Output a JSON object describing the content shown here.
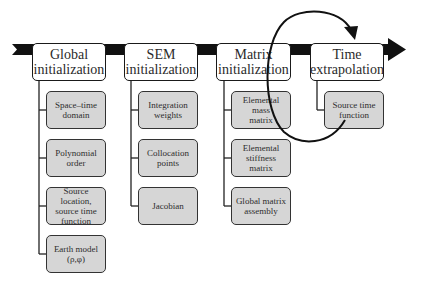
{
  "diagram": {
    "type": "process-flow",
    "direction": "left-to-right",
    "colors": {
      "arrow": "#111111",
      "header_fill": "#ffffff",
      "sub_fill": "#d6d6d6",
      "border": "#1a1a1a"
    },
    "stages": [
      {
        "label": "Global\ninitialization",
        "steps": [
          "Space–time\ndomain",
          "Polynomial\norder",
          "Source location,\nsource time\nfunction",
          "Earth model\n(ρ,φ)"
        ]
      },
      {
        "label": "SEM\ninitialization",
        "steps": [
          "Integration\nweights",
          "Collocation\npoints",
          "Jacobian"
        ]
      },
      {
        "label": "Matrix\ninitialization",
        "steps": [
          "Elemental mass\nmatrix",
          "Elemental\nstiffness matrix",
          "Global matrix\nassembly"
        ]
      },
      {
        "label": "Time\nextrapolation",
        "steps": [
          "Source time\nfunction"
        ],
        "loop": true
      }
    ]
  }
}
